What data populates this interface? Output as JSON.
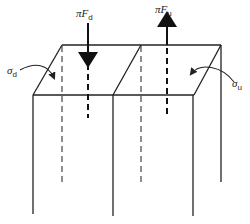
{
  "diagram": {
    "type": "3d-slab-force-diagram",
    "labels": {
      "force_down": {
        "prefix": "πF",
        "subscript": "d"
      },
      "force_up": {
        "prefix": "πF",
        "subscript": "u"
      },
      "stress_down": {
        "symbol": "σ",
        "subscript": "d"
      },
      "stress_up": {
        "symbol": "σ",
        "subscript": "u"
      }
    },
    "colors": {
      "line": "#222222",
      "background": "#ffffff"
    }
  }
}
